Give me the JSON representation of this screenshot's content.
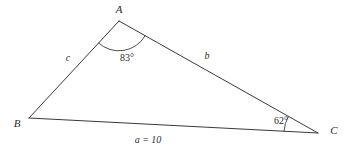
{
  "figure": {
    "background_color": "#ffffff",
    "stroke_color": "#3a3a3a",
    "text_color": "#2b2b2b"
  },
  "vertices": [
    {
      "name": "A",
      "label": "A",
      "x": 119,
      "y": 21,
      "label_x": 119,
      "label_y": 9
    },
    {
      "name": "B",
      "label": "B",
      "x": 29,
      "y": 118,
      "label_x": 17,
      "label_y": 123
    },
    {
      "name": "C",
      "label": "C",
      "x": 318,
      "y": 133,
      "label_x": 334,
      "label_y": 130
    }
  ],
  "sides": [
    {
      "name": "a",
      "label": "a = 10",
      "between": "B-C",
      "label_x": 148,
      "label_y": 140
    },
    {
      "name": "b",
      "label": "b",
      "between": "A-C",
      "label_x": 207,
      "label_y": 56
    },
    {
      "name": "c",
      "label": "c",
      "between": "A-B",
      "label_x": 68,
      "label_y": 58
    }
  ],
  "angles": [
    {
      "at": "A",
      "label": "83°",
      "value": 83,
      "unit": "degrees",
      "label_x": 127,
      "label_y": 58,
      "arc_radius": 30
    },
    {
      "at": "C",
      "label": "62°",
      "value": 62,
      "unit": "degrees",
      "label_x": 281,
      "label_y": 121,
      "arc_radius": 34
    }
  ],
  "chart_data": {
    "type": "diagram",
    "known": {
      "angle_A_degrees": 83,
      "angle_C_degrees": 62,
      "side_a_length": 10
    },
    "labels": [
      "A",
      "B",
      "C",
      "a = 10",
      "b",
      "c",
      "83°",
      "62°"
    ]
  }
}
